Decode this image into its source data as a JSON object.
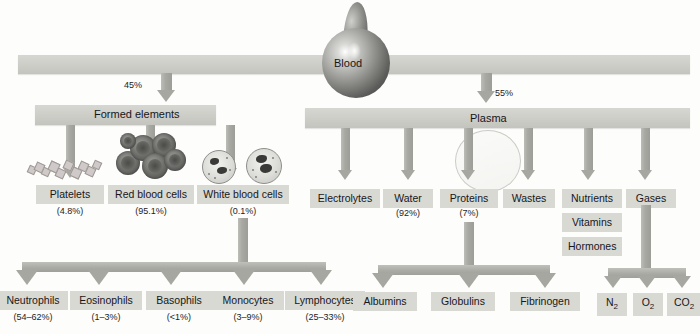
{
  "diagram": {
    "root": {
      "label": "Blood",
      "icon": "blood-drop-icon"
    },
    "split": [
      {
        "label": "Formed elements",
        "percent": "45%"
      },
      {
        "label": "Plasma",
        "percent": "55%"
      }
    ],
    "formed_elements": [
      {
        "label": "Platelets",
        "percent": "(4.8%)",
        "icon": "platelet-cluster-icon"
      },
      {
        "label": "Red blood cells",
        "percent": "(95.1%)",
        "icon": "red-blood-cell-icon"
      },
      {
        "label": "White blood cells",
        "percent": "(0.1%)",
        "icon": "white-blood-cell-icon"
      }
    ],
    "plasma_components": [
      {
        "label": "Electrolytes",
        "percent": ""
      },
      {
        "label": "Water",
        "percent": "(92%)"
      },
      {
        "label": "Proteins",
        "percent": "(7%)"
      },
      {
        "label": "Wastes",
        "percent": ""
      },
      {
        "label": "Nutrients",
        "percent": ""
      },
      {
        "label": "Gases",
        "percent": ""
      }
    ],
    "nutrient_extras": [
      {
        "label": "Vitamins"
      },
      {
        "label": "Hormones"
      }
    ],
    "leukocytes": [
      {
        "label": "Neutrophils",
        "percent": "(54–62%)"
      },
      {
        "label": "Eosinophils",
        "percent": "(1–3%)"
      },
      {
        "label": "Basophils",
        "percent": "(<1%)"
      },
      {
        "label": "Monocytes",
        "percent": "(3–9%)"
      },
      {
        "label": "Lymphocytes",
        "percent": "(25–33%)"
      }
    ],
    "proteins": [
      {
        "label": "Albumins"
      },
      {
        "label": "Globulins"
      },
      {
        "label": "Fibrinogen"
      }
    ],
    "gases": [
      {
        "label": "N",
        "sub": "2"
      },
      {
        "label": "O",
        "sub": "2"
      },
      {
        "label": "CO",
        "sub": "2"
      }
    ]
  },
  "colors": {
    "bar": "#cfcfca",
    "label_box": "#d9d9d4",
    "arrow": "#a7a7a2",
    "text": "#17171a"
  }
}
